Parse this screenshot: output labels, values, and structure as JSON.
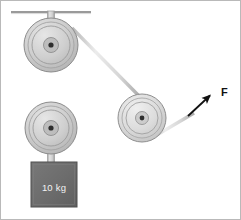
{
  "figure": {
    "canvas": {
      "width": 241,
      "height": 220,
      "background": "#ffffff"
    },
    "border": {
      "visible": true,
      "color": "#b9b9b9",
      "width": 1
    }
  },
  "labels": {
    "weight": "10 kg",
    "force": "F"
  },
  "colors": {
    "ceiling": "#9a9a9a",
    "rope": "#dcdcdc",
    "rope_edge": "#a8a8a8",
    "pulley_fill": "#cfcfcf",
    "pulley_fill_light": "#dedede",
    "pulley_edge": "#8c8c8c",
    "pulley_hub": "#bdbdbd",
    "pulley_axle": "#2e2e2e",
    "rod": "#cccccc",
    "rod_edge": "#9b9b9b",
    "weight_block": "#6e6e6e",
    "weight_block_edge": "#545454",
    "arrow": "#111111",
    "label_text": "#f2f2f2",
    "force_text": "#111111"
  },
  "ceiling": {
    "x1": 11,
    "y1": 12,
    "x2": 91,
    "y2": 12,
    "thickness": 2
  },
  "pulleys": [
    {
      "id": "top-pulley",
      "cx": 51,
      "cy": 45,
      "outer_r": 27,
      "rim_r": 23,
      "groove_r": 19,
      "hub_r": 7,
      "axle_r": 2.6
    },
    {
      "id": "bottom-pulley",
      "cx": 51,
      "cy": 128,
      "outer_r": 26,
      "rim_r": 22,
      "groove_r": 18,
      "hub_r": 7,
      "axle_r": 2.6
    },
    {
      "id": "right-pulley",
      "cx": 142,
      "cy": 118,
      "outer_r": 24,
      "rim_r": 20,
      "groove_r": 16,
      "hub_r": 6,
      "axle_r": 2.4
    }
  ],
  "rods": [
    {
      "id": "ceiling-hanger-rod",
      "x1": 51,
      "y1": 12,
      "x2": 51,
      "y2": 45,
      "width": 7
    },
    {
      "id": "weight-hanger-rod",
      "x1": 51,
      "y1": 128,
      "x2": 51,
      "y2": 165,
      "width": 7
    }
  ],
  "ropes": [
    {
      "id": "rope-left-vertical",
      "x1": 25,
      "y1": 45,
      "x2": 25,
      "y2": 128,
      "width": 3
    },
    {
      "id": "rope-right-vertical",
      "x1": 77,
      "y1": 45,
      "x2": 77,
      "y2": 128,
      "width": 3
    },
    {
      "id": "rope-diagonal-top-to-right",
      "x1": 76,
      "y1": 34,
      "x2": 133,
      "y2": 96,
      "width": 3
    },
    {
      "id": "rope-right-to-force",
      "x1": 155,
      "y1": 135,
      "x2": 192,
      "y2": 114,
      "width": 3
    }
  ],
  "weight_block": {
    "x": 31,
    "y": 162,
    "width": 46,
    "height": 45,
    "label_x": 54,
    "label_y": 188
  },
  "force_arrow": {
    "tail_x": 188,
    "tail_y": 116,
    "tip_x": 213,
    "tip_y": 93,
    "shaft_width": 1.8,
    "head_length": 11,
    "head_width": 8,
    "label_x": 222,
    "label_y": 91
  }
}
